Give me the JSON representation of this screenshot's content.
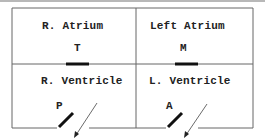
{
  "diagram": {
    "chambers": [
      {
        "id": "right-atrium",
        "label": "R. Atrium"
      },
      {
        "id": "left-atrium",
        "label": "Left Atrium"
      },
      {
        "id": "right-ventricle",
        "label": "R. Ventricle"
      },
      {
        "id": "left-ventricle",
        "label": "L. Ventricle"
      }
    ],
    "valves": [
      {
        "id": "tricuspid",
        "letter": "T"
      },
      {
        "id": "mitral",
        "letter": "M"
      },
      {
        "id": "pulmonary",
        "letter": "P"
      },
      {
        "id": "aortic",
        "letter": "A"
      }
    ],
    "colors": {
      "line": "#555555",
      "valve": "#111111",
      "text": "#222222",
      "topbar": "#b8b8b8"
    }
  }
}
